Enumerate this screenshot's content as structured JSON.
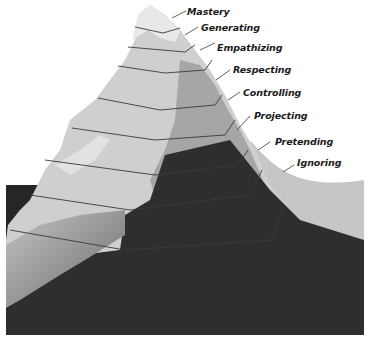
{
  "diagram": {
    "type": "layered-mountain",
    "colors": {
      "background": "#ffffff",
      "snow_light": "#dcdcdc",
      "rock_mid": "#b4b4b4",
      "rock_shadow": "#8a8a8a",
      "underwater_dark": "#262626",
      "water_band": "#c8c8c8",
      "layer_line": "#3a3a3a",
      "label_text": "#1a1a1a"
    },
    "levels": [
      {
        "label": "Mastery"
      },
      {
        "label": "Generating"
      },
      {
        "label": "Empathizing"
      },
      {
        "label": "Respecting"
      },
      {
        "label": "Controlling"
      },
      {
        "label": "Projecting"
      },
      {
        "label": "Pretending"
      },
      {
        "label": "Ignoring"
      }
    ]
  }
}
